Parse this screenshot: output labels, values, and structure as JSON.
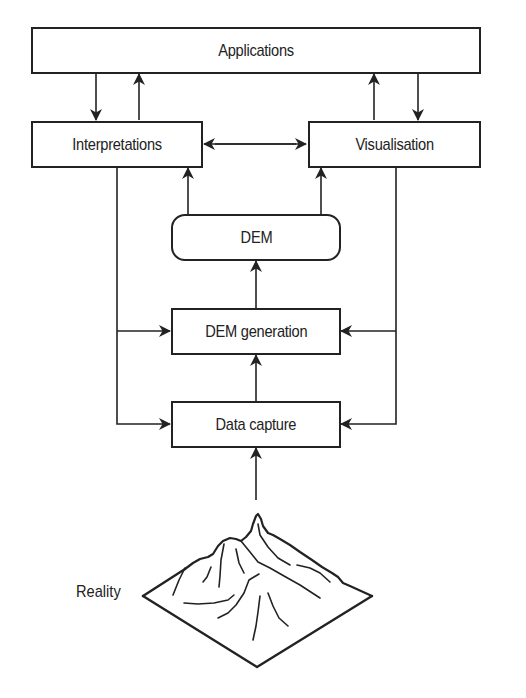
{
  "diagram": {
    "title": "",
    "nodes": {
      "applications": "Applications",
      "interpretations": "Interpretations",
      "visualisation": "Visualisation",
      "dem": "DEM",
      "dem_generation": "DEM generation",
      "data_capture": "Data capture",
      "reality": "Reality"
    },
    "edges": [
      {
        "from": "Applications",
        "to": "Interpretations"
      },
      {
        "from": "Interpretations",
        "to": "Applications"
      },
      {
        "from": "Visualisation",
        "to": "Applications"
      },
      {
        "from": "Applications",
        "to": "Visualisation"
      },
      {
        "from": "Interpretations",
        "to": "Visualisation",
        "bidirectional": true
      },
      {
        "from": "DEM",
        "to": "Interpretations"
      },
      {
        "from": "DEM",
        "to": "Visualisation"
      },
      {
        "from": "DEM generation",
        "to": "DEM"
      },
      {
        "from": "Interpretations",
        "to": "DEM generation"
      },
      {
        "from": "Visualisation",
        "to": "DEM generation"
      },
      {
        "from": "Interpretations",
        "to": "Data capture"
      },
      {
        "from": "Visualisation",
        "to": "Data capture"
      },
      {
        "from": "Data capture",
        "to": "DEM generation"
      },
      {
        "from": "Reality",
        "to": "Data capture"
      }
    ],
    "icons": [
      "mountain-terrain-icon"
    ],
    "colors": {
      "stroke": "#222222",
      "background": "#ffffff"
    }
  }
}
